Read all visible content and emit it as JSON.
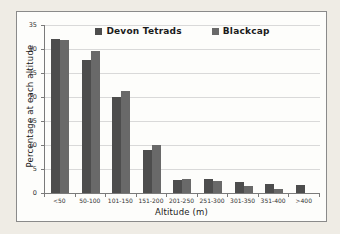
{
  "window": {
    "background": "#efece5",
    "frame_background": "#fdfdfb",
    "frame_border": "#8a8a8a"
  },
  "chart_data": {
    "type": "bar",
    "title": "",
    "xlabel": "Altitude (m)",
    "ylabel": "Percentage at each altitude",
    "categories": [
      "<50",
      "50-100",
      "101-150",
      "151-200",
      "201-250",
      "251-300",
      "301-350",
      "351-400",
      ">400"
    ],
    "series": [
      {
        "name": "Devon Tetrads",
        "color": "#4d4d4d",
        "values": [
          32.0,
          27.8,
          20.0,
          9.0,
          2.8,
          2.9,
          2.2,
          1.9,
          1.6
        ]
      },
      {
        "name": "Blackcap",
        "color": "#696969",
        "values": [
          31.8,
          29.6,
          21.2,
          9.9,
          3.0,
          2.4,
          1.5,
          0.8,
          0
        ]
      }
    ],
    "ylim": [
      0,
      35
    ],
    "yticks": [
      0,
      5,
      10,
      15,
      20,
      25,
      30,
      35
    ],
    "grid": "horizontal",
    "legend_position": "top-center-inside",
    "colors": {
      "gridline": "#d9d9d9",
      "axis_line": "#7a7a7a",
      "tick_text": "#333333",
      "axis_title_text": "#1a1a1a"
    }
  }
}
